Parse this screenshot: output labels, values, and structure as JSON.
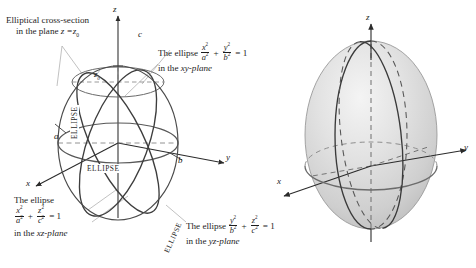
{
  "figure": {
    "background_color": "#ffffff",
    "ink_color": "#1a1a1a",
    "curve_color": "#3a3a3a",
    "axis_color": "#2b2b2b",
    "leader_color": "#9a9a9a",
    "surface_fill_light": "#f0f0f0",
    "surface_fill_mid": "#dcdcdc",
    "surface_fill_dark": "#bdbdbd",
    "surface_outline": "#8f8f8f"
  },
  "left_panel": {
    "name": "wireframe-ellipsoid-diagram",
    "axes": {
      "z_label": "z",
      "y_label": "y",
      "x_label": "x"
    },
    "point_labels": {
      "top_c": "c",
      "x_intercept_a": "a",
      "y_intercept_b": "b",
      "plane_height": "z",
      "plane_height_sub": "0"
    },
    "curve_labels": [
      {
        "name": "ellipse-label-xy-plane",
        "text": "ELLIPSE",
        "x": 86,
        "y": 168,
        "rotate": 0
      },
      {
        "name": "ellipse-label-xz-plane",
        "text": "ELLIPSE",
        "x": 93,
        "y": 148,
        "rotate": -90
      },
      {
        "name": "ellipse-label-yz-plane",
        "text": "ELLIPSE",
        "x": 176,
        "y": 215,
        "rotate": -68
      }
    ],
    "captions": [
      {
        "name": "caption-cross-section",
        "lines": [
          "Elliptical cross-section",
          "in the plane z = z0"
        ],
        "x": 8,
        "y": 17
      },
      {
        "name": "caption-xy-plane-ellipse",
        "lines": [
          "The ellipse  x^2/a^2 + y^2/b^2 = 1",
          "in the xy-plane"
        ],
        "x": 160,
        "y": 45
      },
      {
        "name": "caption-xz-plane-ellipse",
        "lines": [
          "The ellipse",
          "x^2/a^2 + z^2/c^2 = 1",
          "in the xz-plane"
        ],
        "x": 18,
        "y": 196
      },
      {
        "name": "caption-yz-plane-ellipse",
        "lines": [
          "The ellipse  y^2/b^2 + z^2/c^2 = 1",
          "in the yz-plane"
        ],
        "x": 188,
        "y": 218
      }
    ],
    "equation_text": {
      "the_ellipse": "The ellipse",
      "in_the": "in the",
      "equals_one": "= 1",
      "plus": "+",
      "xy_plane": "xy-plane",
      "xz_plane": "xz-plane",
      "yz_plane": "yz-plane",
      "elliptical_cross_section": "Elliptical cross-section",
      "in_the_plane": "in the plane",
      "z_equals": "z =",
      "z_naught": "z",
      "naught": "0",
      "x": "x",
      "y": "y",
      "z": "z",
      "a": "a",
      "b": "b",
      "c": "c",
      "two": "2"
    }
  },
  "right_panel": {
    "name": "shaded-ellipsoid-diagram",
    "axes": {
      "z_label": "z",
      "y_label": "y",
      "x_label": "x"
    }
  }
}
